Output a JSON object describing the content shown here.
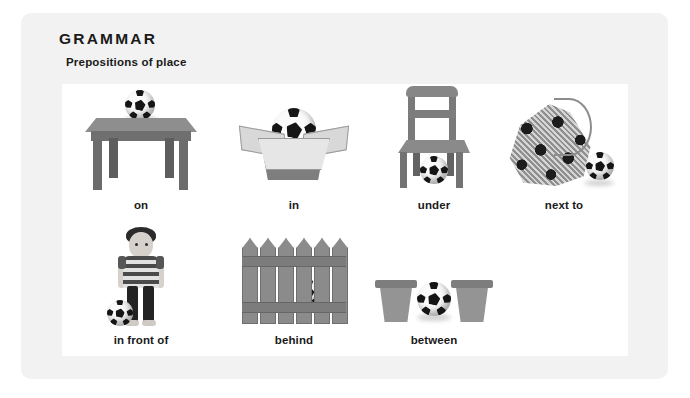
{
  "header": {
    "title": "GRAMMAR",
    "subtitle": "Prepositions of place"
  },
  "rows": [
    {
      "items": [
        {
          "caption": "on",
          "illustration": "ball-on-table-icon"
        },
        {
          "caption": "in",
          "illustration": "ball-in-box-icon"
        },
        {
          "caption": "under",
          "illustration": "ball-under-chair-icon"
        },
        {
          "caption": "next to",
          "illustration": "ball-next-to-bag-icon"
        }
      ]
    },
    {
      "items": [
        {
          "caption": "in front of",
          "illustration": "ball-in-front-of-boy-icon"
        },
        {
          "caption": "behind",
          "illustration": "ball-behind-fence-icon"
        },
        {
          "caption": "between",
          "illustration": "ball-between-pots-icon"
        }
      ]
    }
  ],
  "colors": {
    "panel_background": "#f2f2f2",
    "card_background": "#ffffff",
    "text": "#1a1a1a",
    "illustration_gray": "#8a8a8a"
  }
}
